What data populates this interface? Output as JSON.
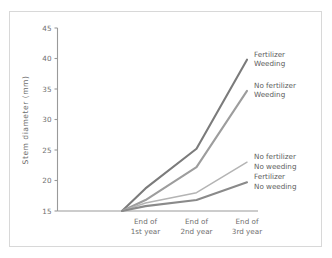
{
  "chart_data": {
    "type": "line",
    "title": "",
    "subtitle": "",
    "xlabel": "",
    "ylabel": "Stem diameter (mm)",
    "categories": [
      "",
      "End of 1st year",
      "End of 2nd year",
      "End of 3rd year"
    ],
    "category_lines": [
      [
        "",
        ""
      ],
      [
        "End of",
        "1st year"
      ],
      [
        "End of",
        "2nd year"
      ],
      [
        "End of",
        "3rd year"
      ]
    ],
    "ylim": [
      15,
      45
    ],
    "yticks": [
      15,
      20,
      25,
      30,
      35,
      40,
      45
    ],
    "ytick_labels": [
      "15",
      "20",
      "25",
      "30",
      "35",
      "40",
      "45"
    ],
    "grid": false,
    "legend_position": "right-inline-annotations",
    "series": [
      {
        "name": "Fertilizer Weeding",
        "label_lines": [
          "Fertilizer",
          "Weeding"
        ],
        "color": "#7b7b7b",
        "width": 2.1,
        "values": [
          15.0,
          18.7,
          25.2,
          39.8
        ]
      },
      {
        "name": "No fertilizer Weeding",
        "label_lines": [
          "No fertilizer",
          "Weeding"
        ],
        "color": "#9d9d9d",
        "width": 2.1,
        "values": [
          15.0,
          16.8,
          22.2,
          34.7
        ]
      },
      {
        "name": "No fertilizer No weeding",
        "label_lines": [
          "No fertilizer",
          "No weeding"
        ],
        "color": "#b4b4b4",
        "width": 1.5,
        "values": [
          15.0,
          16.3,
          18.0,
          23.0
        ]
      },
      {
        "name": "Fertilizer No weeding",
        "label_lines": [
          "Fertilizer",
          "No weeding"
        ],
        "color": "#8a8a8a",
        "width": 2.1,
        "values": [
          15.0,
          15.8,
          16.8,
          19.7
        ]
      }
    ],
    "axis_color": "#9a9a9a",
    "background_color": "#ffffff",
    "frame_color": "#d8d8d8"
  }
}
